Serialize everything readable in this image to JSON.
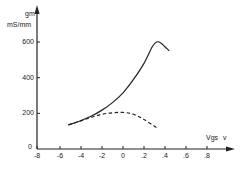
{
  "chart_data": {
    "type": "line",
    "title": "",
    "xlabel": "Vgs",
    "xunit": "v",
    "ylabel": "gm",
    "yunit": "mS/mm",
    "xlim": [
      -0.8,
      0.9
    ],
    "ylim": [
      0,
      650
    ],
    "grid": false,
    "legend": null,
    "x_ticks": [
      "-8",
      "-6",
      "-4",
      "-2",
      "0",
      ".2",
      ".4",
      ".6",
      ".8"
    ],
    "x_tick_values": [
      -0.8,
      -0.6,
      -0.4,
      -0.2,
      0,
      0.2,
      0.4,
      0.6,
      0.8
    ],
    "y_ticks": [
      "0",
      "200",
      "400",
      "600"
    ],
    "y_tick_values": [
      0,
      200,
      400,
      600
    ],
    "series": [
      {
        "name": "solid",
        "style": "solid",
        "x": [
          -0.52,
          -0.4,
          -0.3,
          -0.2,
          -0.1,
          0.0,
          0.1,
          0.2,
          0.28,
          0.32,
          0.36,
          0.44
        ],
        "y": [
          135,
          160,
          185,
          218,
          260,
          315,
          390,
          480,
          575,
          600,
          595,
          550
        ]
      },
      {
        "name": "dashed",
        "style": "dashed",
        "x": [
          -0.52,
          -0.4,
          -0.3,
          -0.2,
          -0.1,
          0.0,
          0.1,
          0.2,
          0.32
        ],
        "y": [
          135,
          158,
          178,
          195,
          203,
          205,
          195,
          165,
          120
        ]
      }
    ]
  },
  "axes": {
    "y_label_top": "gm",
    "y_label_unit": "mS/mm",
    "x_label": "Vgs",
    "x_unit": "v"
  }
}
